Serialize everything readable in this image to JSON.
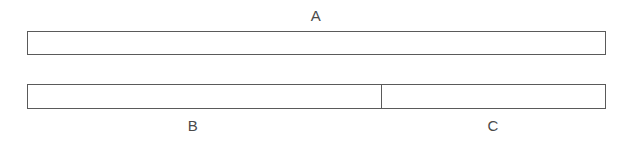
{
  "diagram": {
    "type": "tape-diagram",
    "background_color": "#ffffff",
    "stroke_color": "#5a5a5a",
    "fill_color": "#ffffff",
    "label_color": "#4a4a4a",
    "bars": [
      {
        "id": "A",
        "label": "A",
        "label_position": "above",
        "segments": [
          {
            "id": "A",
            "label": "A",
            "fraction": 1.0
          }
        ]
      },
      {
        "id": "BC",
        "label_position": "below",
        "segments": [
          {
            "id": "B",
            "label": "B",
            "fraction": 0.611
          },
          {
            "id": "C",
            "label": "C",
            "fraction": 0.389
          }
        ]
      }
    ],
    "labels": {
      "a": "A",
      "b": "B",
      "c": "C"
    }
  }
}
